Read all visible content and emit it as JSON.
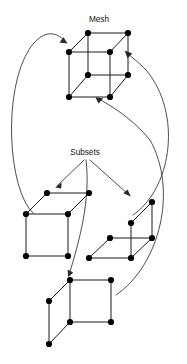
{
  "figure": {
    "title_label": "Mesh",
    "subsets_label": "Subsets",
    "background_color": "#ffffff",
    "node_color": "#000000",
    "edge_color": "#1a1a1a",
    "arrow_color": "#3a3a3a",
    "label_color": "#111111",
    "width": 187,
    "height": 364
  },
  "labels": [
    {
      "name": "mesh",
      "text": "Mesh",
      "x": 99,
      "y": 22
    },
    {
      "name": "subsets",
      "text": "Subsets",
      "x": 85,
      "y": 155
    }
  ],
  "graphs": [
    {
      "name": "mesh-cube",
      "label": "Mesh",
      "nodes": [
        {
          "id": "top-back-left",
          "x": 88,
          "y": 33
        },
        {
          "id": "top-back-right",
          "x": 128,
          "y": 33
        },
        {
          "id": "top-front-left",
          "x": 69,
          "y": 52
        },
        {
          "id": "top-front-right",
          "x": 110,
          "y": 52
        },
        {
          "id": "bottom-back-left",
          "x": 88,
          "y": 75
        },
        {
          "id": "bottom-back-right",
          "x": 128,
          "y": 75
        },
        {
          "id": "bottom-front-left",
          "x": 69,
          "y": 97
        },
        {
          "id": "bottom-front-right",
          "x": 110,
          "y": 97
        }
      ],
      "edges": [
        [
          "top-back-left",
          "top-back-right"
        ],
        [
          "top-back-left",
          "top-front-left"
        ],
        [
          "top-back-right",
          "top-front-right"
        ],
        [
          "top-front-left",
          "top-front-right"
        ],
        [
          "top-back-left",
          "bottom-back-left"
        ],
        [
          "top-back-right",
          "bottom-back-right"
        ],
        [
          "top-front-left",
          "bottom-front-left"
        ],
        [
          "top-front-right",
          "bottom-front-right"
        ],
        [
          "bottom-back-left",
          "bottom-back-right"
        ],
        [
          "bottom-back-left",
          "bottom-front-left"
        ],
        [
          "bottom-back-right",
          "bottom-front-right"
        ],
        [
          "bottom-front-left",
          "bottom-front-right"
        ]
      ]
    },
    {
      "name": "subset-cube-left",
      "label": "",
      "nodes": [
        {
          "id": "top-back-left",
          "x": 47,
          "y": 193
        },
        {
          "id": "top-back-right",
          "x": 89,
          "y": 193
        },
        {
          "id": "top-front-left",
          "x": 26,
          "y": 214
        },
        {
          "id": "top-front-right",
          "x": 68,
          "y": 214
        },
        {
          "id": "bottom-front-left",
          "x": 26,
          "y": 256
        },
        {
          "id": "bottom-front-right",
          "x": 68,
          "y": 256
        }
      ],
      "edges": [
        [
          "top-back-left",
          "top-back-right"
        ],
        [
          "top-back-left",
          "top-front-left"
        ],
        [
          "top-back-right",
          "top-front-right"
        ],
        [
          "top-front-left",
          "top-front-right"
        ],
        [
          "top-front-left",
          "bottom-front-left"
        ],
        [
          "top-front-right",
          "bottom-front-right"
        ],
        [
          "bottom-front-left",
          "bottom-front-right"
        ]
      ]
    },
    {
      "name": "subset-cube-right",
      "label": "",
      "nodes": [
        {
          "id": "top-back-right",
          "x": 152,
          "y": 202
        },
        {
          "id": "top-front-right",
          "x": 131,
          "y": 223
        },
        {
          "id": "mid-back-left",
          "x": 110,
          "y": 238
        },
        {
          "id": "mid-back-right",
          "x": 152,
          "y": 238
        },
        {
          "id": "bottom-front-left",
          "x": 89,
          "y": 258
        },
        {
          "id": "bottom-front-right",
          "x": 131,
          "y": 258
        }
      ],
      "edges": [
        [
          "top-back-right",
          "top-front-right"
        ],
        [
          "top-back-right",
          "mid-back-right"
        ],
        [
          "top-front-right",
          "bottom-front-right"
        ],
        [
          "mid-back-left",
          "mid-back-right"
        ],
        [
          "mid-back-left",
          "bottom-front-left"
        ],
        [
          "mid-back-right",
          "bottom-front-right"
        ],
        [
          "bottom-front-left",
          "bottom-front-right"
        ]
      ]
    },
    {
      "name": "subset-cube-bottom",
      "label": "",
      "nodes": [
        {
          "id": "top-back-left",
          "x": 70,
          "y": 280
        },
        {
          "id": "top-back-right",
          "x": 111,
          "y": 280
        },
        {
          "id": "mid-front-left",
          "x": 49,
          "y": 301
        },
        {
          "id": "bottom-back-left",
          "x": 70,
          "y": 322
        },
        {
          "id": "bottom-back-right",
          "x": 111,
          "y": 322
        },
        {
          "id": "bottom-front-left",
          "x": 49,
          "y": 344
        }
      ],
      "edges": [
        [
          "top-back-left",
          "top-back-right"
        ],
        [
          "top-back-left",
          "mid-front-left"
        ],
        [
          "top-back-left",
          "bottom-back-left"
        ],
        [
          "top-back-right",
          "bottom-back-right"
        ],
        [
          "mid-front-left",
          "bottom-front-left"
        ],
        [
          "bottom-back-left",
          "bottom-back-right"
        ],
        [
          "bottom-back-left",
          "bottom-front-left"
        ]
      ]
    }
  ],
  "arrows": [
    {
      "name": "subsets-to-left-cube",
      "kind": "straight",
      "from": {
        "x": 84,
        "y": 160
      },
      "to": {
        "x": 56,
        "y": 187
      },
      "description": "Subsets label to left subset cube"
    },
    {
      "name": "subsets-to-bottom-cube",
      "kind": "curve",
      "path": "M 86 160 C 90 200, 78 240, 68 276",
      "to": {
        "x": 68,
        "y": 276
      },
      "description": "Subsets label to bottom subset cube"
    },
    {
      "name": "subsets-to-right-cube",
      "kind": "straight",
      "from": {
        "x": 90,
        "y": 160
      },
      "to": {
        "x": 130,
        "y": 196
      },
      "description": "Subsets label to right subset cube"
    },
    {
      "name": "left-cube-to-mesh",
      "kind": "curve",
      "path": "M 33 213 C 8 190, 2 90, 30 48 C 45 27, 58 33, 66 42",
      "to": {
        "x": 66,
        "y": 42
      },
      "description": "Left subset cube back to Mesh cube"
    },
    {
      "name": "right-cube-to-mesh",
      "kind": "curve",
      "path": "M 133 215 C 170 190, 182 120, 150 75 C 142 64, 132 58, 126 52",
      "to": {
        "x": 126,
        "y": 52
      },
      "description": "Right subset cube back to Mesh cube"
    },
    {
      "name": "bottom-cube-to-mesh",
      "kind": "curve",
      "path": "M 116 295 C 160 265, 178 190, 150 140 C 132 118, 110 105, 97 98",
      "to": {
        "x": 97,
        "y": 98
      },
      "description": "Bottom subset cube back to Mesh cube"
    }
  ]
}
